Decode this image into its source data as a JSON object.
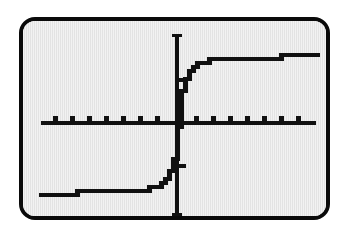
{
  "figure": {
    "kind": "graphing-calculator-screen",
    "bezel_color": "#0a0a0a",
    "screen_color": "#e3e3e3",
    "ink_color": "#111111"
  },
  "chart_data": {
    "type": "line",
    "title": "",
    "subtitle": "",
    "xlabel": "",
    "ylabel": "",
    "grid": false,
    "legend": null,
    "legend_position": "none",
    "annotations": [],
    "xlim": [
      -8,
      8
    ],
    "ylim": [
      -2,
      2
    ],
    "xticks": [
      -7,
      -6,
      -5,
      -4,
      -3,
      -2,
      -1,
      1,
      2,
      3,
      4,
      5,
      6,
      7
    ],
    "yticks": [
      -1,
      1
    ],
    "xtick_labels": [],
    "ytick_labels": [],
    "axis_origin": [
      0,
      0
    ],
    "asymptotes": [
      -1.57,
      1.57
    ],
    "series": [
      {
        "name": "y = arctan(4x)",
        "x": [
          -8.0,
          -7.6,
          -7.2,
          -6.8,
          -6.4,
          -6.0,
          -5.6,
          -5.2,
          -4.8,
          -4.4,
          -4.0,
          -3.6,
          -3.2,
          -2.8,
          -2.4,
          -2.0,
          -1.7,
          -1.4,
          -1.2,
          -1.0,
          -0.85,
          -0.7,
          -0.58,
          -0.46,
          -0.36,
          -0.28,
          -0.21,
          -0.15,
          -0.1,
          -0.06,
          -0.03,
          0.0,
          0.03,
          0.06,
          0.1,
          0.15,
          0.21,
          0.28,
          0.36,
          0.46,
          0.58,
          0.7,
          0.85,
          1.0,
          1.2,
          1.4,
          1.7,
          2.0,
          2.4,
          2.8,
          3.2,
          3.6,
          4.0,
          4.4,
          4.8,
          5.2,
          5.6,
          6.0,
          6.4,
          6.8,
          7.2,
          7.6,
          8.0
        ],
        "y": [
          -1.539,
          -1.538,
          -1.536,
          -1.534,
          -1.532,
          -1.529,
          -1.526,
          -1.523,
          -1.519,
          -1.514,
          -1.508,
          -1.502,
          -1.493,
          -1.482,
          -1.468,
          -1.449,
          -1.429,
          -1.404,
          -1.379,
          -1.326,
          -1.286,
          -1.228,
          -1.164,
          -1.072,
          -0.963,
          -0.843,
          -0.698,
          -0.54,
          -0.381,
          -0.236,
          -0.12,
          0.0,
          0.12,
          0.236,
          0.381,
          0.54,
          0.698,
          0.843,
          0.963,
          1.072,
          1.164,
          1.228,
          1.286,
          1.326,
          1.379,
          1.404,
          1.429,
          1.449,
          1.468,
          1.482,
          1.493,
          1.502,
          1.508,
          1.514,
          1.519,
          1.523,
          1.526,
          1.529,
          1.532,
          1.534,
          1.536,
          1.538,
          1.539
        ],
        "color": "#111111",
        "style": "stepped-pixel"
      }
    ]
  }
}
